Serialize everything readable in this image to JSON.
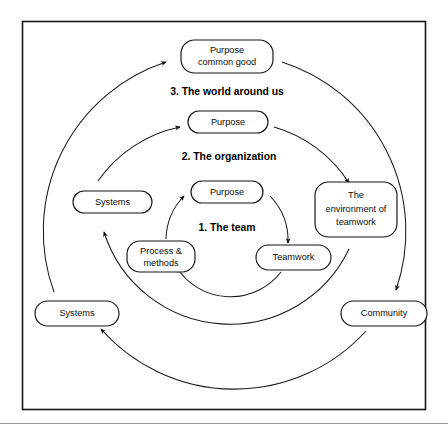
{
  "figure": {
    "kind": "concentric-cycle-diagram",
    "border_color": "#161616",
    "line_color": "#1a1a1a",
    "text_color": "#0d0d0d",
    "background": "#ffffff"
  },
  "ring_titles": [
    {
      "id": "ring-3",
      "text": "3. The world around us"
    },
    {
      "id": "ring-2",
      "text": "2. The organization"
    },
    {
      "id": "ring-1",
      "text": "1. The team"
    }
  ],
  "nodes": [
    {
      "id": "purpose-common-good",
      "name": "node-purpose-common-good",
      "ring": 3,
      "lines": [
        "Purpose",
        "common good"
      ]
    },
    {
      "id": "systems-outer",
      "name": "node-systems-outer",
      "ring": 3,
      "lines": [
        "Systems"
      ]
    },
    {
      "id": "community",
      "name": "node-community",
      "ring": 3,
      "lines": [
        "Community"
      ]
    },
    {
      "id": "purpose-org",
      "name": "node-purpose-organization",
      "ring": 2,
      "lines": [
        "Purpose"
      ]
    },
    {
      "id": "systems-inner",
      "name": "node-systems-organization",
      "ring": 2,
      "lines": [
        "Systems"
      ]
    },
    {
      "id": "environment",
      "name": "node-environment-of-teamwork",
      "ring": 2,
      "lines": [
        "The",
        "environment of",
        "teamwork"
      ]
    },
    {
      "id": "purpose-team",
      "name": "node-purpose-team",
      "ring": 1,
      "lines": [
        "Purpose"
      ]
    },
    {
      "id": "process-methods",
      "name": "node-process-and-methods",
      "ring": 1,
      "lines": [
        "Process &",
        "methods"
      ]
    },
    {
      "id": "teamwork",
      "name": "node-teamwork",
      "ring": 1,
      "lines": [
        "Teamwork"
      ]
    }
  ],
  "edges": [
    {
      "id": "e1",
      "from": "purpose-team",
      "to": "teamwork",
      "ring": 1
    },
    {
      "id": "e2",
      "from": "teamwork",
      "to": "process-methods",
      "ring": 1
    },
    {
      "id": "e3",
      "from": "process-methods",
      "to": "purpose-team",
      "ring": 1
    },
    {
      "id": "e4",
      "from": "purpose-org",
      "to": "environment",
      "ring": 2
    },
    {
      "id": "e5",
      "from": "environment",
      "to": "systems-inner",
      "ring": 2
    },
    {
      "id": "e6",
      "from": "systems-inner",
      "to": "purpose-org",
      "ring": 2
    },
    {
      "id": "e7",
      "from": "purpose-common-good",
      "to": "community",
      "ring": 3
    },
    {
      "id": "e8",
      "from": "community",
      "to": "systems-outer",
      "ring": 3
    },
    {
      "id": "e9",
      "from": "systems-outer",
      "to": "purpose-common-good",
      "ring": 3
    }
  ]
}
